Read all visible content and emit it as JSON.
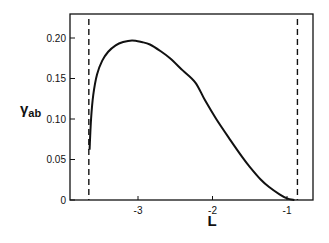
{
  "chart_data": {
    "type": "line",
    "title": "",
    "xlabel": "L",
    "ylabel_main": "γ",
    "ylabel_sub": "ab",
    "xlim": [
      -3.9,
      -0.65
    ],
    "ylim": [
      0,
      0.23
    ],
    "x_ticks": [
      -3,
      -2,
      -1
    ],
    "x_tick_labels": [
      "-3",
      "-2",
      "-1"
    ],
    "y_ticks": [
      0,
      0.05,
      0.1,
      0.15,
      0.2
    ],
    "y_tick_labels": [
      "0",
      "0.05",
      "0.10",
      "0.15",
      "0.20"
    ],
    "grid": false,
    "legend": "none",
    "reference_lines": [
      {
        "name": "left-boundary",
        "x": -3.66,
        "style": "dashed"
      },
      {
        "name": "right-boundary",
        "x": -0.86,
        "style": "dashed"
      }
    ],
    "series": [
      {
        "name": "gamma_ab",
        "x": [
          -3.65,
          -3.63,
          -3.6,
          -3.55,
          -3.48,
          -3.4,
          -3.3,
          -3.2,
          -3.08,
          -2.95,
          -2.84,
          -2.7,
          -2.57,
          -2.4,
          -2.23,
          -2.1,
          -1.95,
          -1.76,
          -1.6,
          -1.5,
          -1.35,
          -1.24,
          -1.1,
          -1.0,
          -0.9
        ],
        "y": [
          0.062,
          0.1,
          0.13,
          0.155,
          0.172,
          0.183,
          0.191,
          0.195,
          0.197,
          0.195,
          0.192,
          0.184,
          0.175,
          0.16,
          0.145,
          0.123,
          0.1,
          0.074,
          0.053,
          0.041,
          0.025,
          0.016,
          0.007,
          0.002,
          0.0
        ]
      }
    ]
  }
}
